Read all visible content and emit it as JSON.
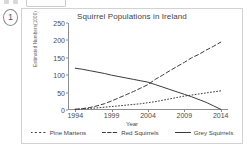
{
  "toolbar": {
    "icon_a": "toolbar-icon",
    "icon_b": "toolbar-icon",
    "field": "toolbar-field"
  },
  "question": {
    "number": "1"
  },
  "chart_data": {
    "type": "line",
    "title": "Squirrel Populations in Ireland",
    "xlabel": "Year",
    "ylabel": "Estimated Numbers(1000)",
    "xlim": [
      1993,
      2015
    ],
    "ylim": [
      0,
      250
    ],
    "grid": false,
    "legend_position": "bottom",
    "xticks": [
      "1994",
      "1999",
      "2004",
      "2009",
      "2014"
    ],
    "xtick_values": [
      1994,
      1999,
      2004,
      2009,
      2014
    ],
    "yticks": [
      "0",
      "50",
      "100",
      "150",
      "200",
      "250"
    ],
    "ytick_values": [
      0,
      50,
      100,
      150,
      200,
      250
    ],
    "x": [
      1994,
      1995,
      1996,
      1997,
      1998,
      1999,
      2000,
      2001,
      2002,
      2003,
      2004,
      2005,
      2006,
      2007,
      2008,
      2009,
      2010,
      2011,
      2012,
      2013,
      2014
    ],
    "series": [
      {
        "name": "Pine Martens",
        "style": "dotted",
        "color": "#3a3a3a",
        "values": [
          2,
          3,
          5,
          6,
          8,
          10,
          12,
          14,
          16,
          18,
          21,
          24,
          28,
          32,
          36,
          40,
          43,
          46,
          49,
          52,
          55
        ]
      },
      {
        "name": "Red Squirrels",
        "style": "dashed",
        "color": "#3a3a3a",
        "values": [
          2,
          4,
          7,
          12,
          18,
          26,
          35,
          44,
          53,
          63,
          73,
          88,
          100,
          113,
          125,
          137,
          150,
          160,
          172,
          183,
          195
        ]
      },
      {
        "name": "Grey Squirrels",
        "style": "solid",
        "color": "#3a3a3a",
        "values": [
          120,
          117,
          113,
          109,
          105,
          100,
          96,
          92,
          88,
          84,
          80,
          73,
          66,
          59,
          52,
          45,
          38,
          30,
          22,
          12,
          2
        ]
      }
    ]
  }
}
